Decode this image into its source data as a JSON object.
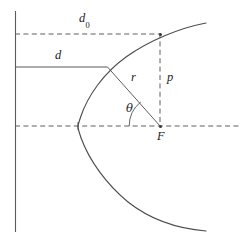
{
  "figure": {
    "type": "geometry-diagram",
    "width": 247,
    "height": 249,
    "background_color": "#ffffff",
    "line_color": "#555555",
    "text_color": "#1c1c1c"
  },
  "labels": {
    "d_zero": "d",
    "d_zero_subscript": "0",
    "d": "d",
    "r": "r",
    "p": "p",
    "theta": "θ",
    "focus": "F"
  },
  "geometry": {
    "directrix": {
      "name": "directrix",
      "x": 15,
      "y_top": 11,
      "y_bottom": 232,
      "style": "solid"
    },
    "focus_point": {
      "x": 160,
      "y": 126
    },
    "vertex_point": {
      "x": 78,
      "y": 126
    },
    "curve_point_d": {
      "x": 107,
      "y": 67
    },
    "curve_point_p": {
      "x": 160,
      "y": 34
    },
    "axis_line": {
      "y": 126,
      "x_start": 15,
      "x_end": 240,
      "style": "dashed"
    },
    "d_zero_line": {
      "y": 34,
      "x_start": 15,
      "x_end": 160,
      "style": "dashed"
    },
    "d_line": {
      "y": 67,
      "x_start": 15,
      "x_end": 107,
      "style": "solid"
    },
    "p_line": {
      "x": 160,
      "y_start": 34,
      "y_end": 126,
      "style": "dashed"
    },
    "r_line": {
      "x1": 107,
      "y1": 67,
      "x2": 160,
      "y2": 126,
      "style": "solid"
    },
    "theta_arc": {
      "center_x": 160,
      "center_y": 126,
      "radius": 31
    },
    "parabola": {
      "focal_distance": 82,
      "opens": "left-wrapping",
      "top_end": {
        "x": 206,
        "y": 23
      },
      "bottom_end": {
        "x": 206,
        "y": 231
      }
    }
  },
  "label_positions": {
    "d_zero": {
      "x": 79,
      "y": 12
    },
    "d": {
      "x": 55,
      "y": 49
    },
    "r": {
      "x": 131,
      "y": 71
    },
    "p": {
      "x": 167,
      "y": 71
    },
    "theta": {
      "x": 126,
      "y": 103
    },
    "focus": {
      "x": 157,
      "y": 130
    }
  }
}
